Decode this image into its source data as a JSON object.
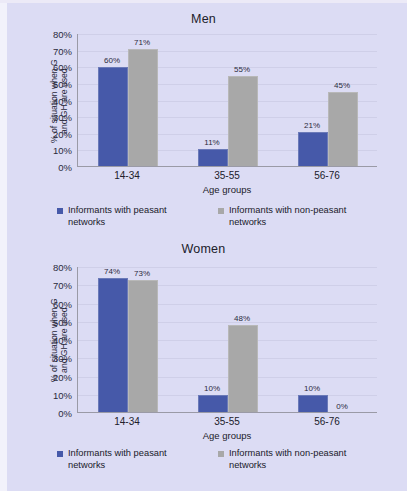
{
  "figure": {
    "background_color": "#dcdcf4",
    "series_colors": {
      "peasant": "#4659a9",
      "non_peasant": "#a8a8a8"
    }
  },
  "legend": {
    "position": "bottom",
    "items": [
      {
        "label": "Informants with peasant networks",
        "color": "#4659a9",
        "swatch_icon": "square-swatch-icon"
      },
      {
        "label": "Informants with non-peasant networks",
        "color": "#a8a8a8",
        "swatch_icon": "square-swatch-icon"
      }
    ]
  },
  "chart_data": [
    {
      "type": "bar",
      "title": "Men",
      "xlabel": "Age groups",
      "ylabel": "% of situation when G\nand GH are used",
      "categories": [
        "14-34",
        "35-55",
        "56-76"
      ],
      "ylim": [
        0,
        80
      ],
      "yticks": [
        "0%",
        "10%",
        "20%",
        "30%",
        "40%",
        "50%",
        "60%",
        "70%",
        "80%"
      ],
      "ytick_values": [
        0,
        10,
        20,
        30,
        40,
        50,
        60,
        70,
        80
      ],
      "grid": true,
      "series": [
        {
          "name": "Informants with peasant networks",
          "color": "#4659a9",
          "values": [
            60,
            11,
            21
          ],
          "labels": [
            "60%",
            "11%",
            "21%"
          ]
        },
        {
          "name": "Informants with non-peasant networks",
          "color": "#a8a8a8",
          "values": [
            71,
            55,
            45
          ],
          "labels": [
            "71%",
            "55%",
            "45%"
          ]
        }
      ]
    },
    {
      "type": "bar",
      "title": "Women",
      "xlabel": "Age groups",
      "ylabel": "% of situation when G\nand GH are used",
      "categories": [
        "14-34",
        "35-55",
        "56-76"
      ],
      "ylim": [
        0,
        80
      ],
      "yticks": [
        "0%",
        "10%",
        "20%",
        "30%",
        "40%",
        "50%",
        "60%",
        "70%",
        "80%"
      ],
      "ytick_values": [
        0,
        10,
        20,
        30,
        40,
        50,
        60,
        70,
        80
      ],
      "grid": true,
      "series": [
        {
          "name": "Informants with peasant networks",
          "color": "#4659a9",
          "values": [
            74,
            10,
            10
          ],
          "labels": [
            "74%",
            "10%",
            "10%"
          ]
        },
        {
          "name": "Informants with non-peasant networks",
          "color": "#a8a8a8",
          "values": [
            73,
            48,
            0
          ],
          "labels": [
            "73%",
            "48%",
            "0%"
          ]
        }
      ]
    }
  ]
}
